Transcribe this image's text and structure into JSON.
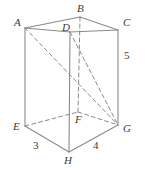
{
  "figure": {
    "kind": "rectangular-prism-diagram",
    "background_color": "#ffffff",
    "line_color": "#8a8a8a",
    "label_color": "#3a3a3a",
    "solid_stroke_width": 1.1,
    "dashed_stroke_width": 1.0,
    "dash_pattern": "4,3",
    "viewbox": "0 0 145 170"
  },
  "vertices": [
    {
      "id": "A",
      "label": "A",
      "x": 25,
      "y": 28,
      "label_x": 14,
      "label_y": 17,
      "hidden": false
    },
    {
      "id": "B",
      "label": "B",
      "x": 80,
      "y": 17,
      "label_x": 77,
      "label_y": 3,
      "hidden": true
    },
    {
      "id": "C",
      "label": "C",
      "x": 118,
      "y": 30,
      "label_x": 123,
      "label_y": 17,
      "hidden": false
    },
    {
      "id": "D",
      "label": "D",
      "x": 70,
      "y": 32,
      "label_x": 62,
      "label_y": 22,
      "hidden": false
    },
    {
      "id": "E",
      "label": "E",
      "x": 25,
      "y": 126,
      "label_x": 13,
      "label_y": 121,
      "hidden": false
    },
    {
      "id": "F",
      "label": "F",
      "x": 78,
      "y": 112,
      "label_x": 75,
      "label_y": 114,
      "hidden": true
    },
    {
      "id": "G",
      "label": "G",
      "x": 118,
      "y": 125,
      "label_x": 123,
      "label_y": 123,
      "hidden": false
    },
    {
      "id": "H",
      "label": "H",
      "x": 69,
      "y": 152,
      "label_x": 64,
      "label_y": 155,
      "hidden": false
    }
  ],
  "edges": [
    {
      "name": "edge-A-B",
      "from": "A",
      "to": "B",
      "style": "solid"
    },
    {
      "name": "edge-B-C",
      "from": "B",
      "to": "C",
      "style": "solid"
    },
    {
      "name": "edge-A-D",
      "from": "A",
      "to": "D",
      "style": "solid"
    },
    {
      "name": "edge-D-C",
      "from": "D",
      "to": "C",
      "style": "solid"
    },
    {
      "name": "edge-A-E",
      "from": "A",
      "to": "E",
      "style": "solid"
    },
    {
      "name": "edge-C-G",
      "from": "C",
      "to": "G",
      "style": "solid"
    },
    {
      "name": "edge-D-H",
      "from": "D",
      "to": "H",
      "style": "solid"
    },
    {
      "name": "edge-B-F",
      "from": "B",
      "to": "F",
      "style": "dashed"
    },
    {
      "name": "edge-E-H",
      "from": "E",
      "to": "H",
      "style": "solid"
    },
    {
      "name": "edge-H-G",
      "from": "H",
      "to": "G",
      "style": "solid"
    },
    {
      "name": "edge-E-F",
      "from": "E",
      "to": "F",
      "style": "dashed"
    },
    {
      "name": "edge-F-G",
      "from": "F",
      "to": "G",
      "style": "dashed"
    },
    {
      "name": "diagonal-A-G",
      "from": "A",
      "to": "G",
      "style": "dashed"
    },
    {
      "name": "diagonal-D-G",
      "from": "D",
      "to": "G",
      "style": "dashed"
    }
  ],
  "measurements": [
    {
      "name": "length-EH",
      "value": "3",
      "x": 33,
      "y": 140,
      "edge": "E-H"
    },
    {
      "name": "length-HG",
      "value": "4",
      "x": 93,
      "y": 140,
      "edge": "H-G"
    },
    {
      "name": "height-CG",
      "value": "5",
      "x": 124,
      "y": 50,
      "edge": "C-G"
    }
  ]
}
